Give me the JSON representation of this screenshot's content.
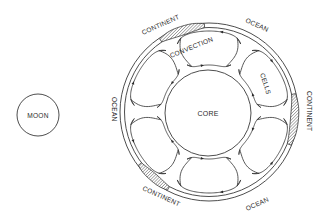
{
  "diagram": {
    "type": "earth-convection-cross-section",
    "labels": {
      "moon": "MOON",
      "core": "CORE",
      "convection": "CONVECTION",
      "cells": "CELLS",
      "continent_top": "CONTINENT",
      "continent_right": "CONTINENT",
      "continent_bottom": "CONTINENT",
      "ocean_top": "OCEAN",
      "ocean_left": "OCEAN",
      "ocean_bottom": "OCEAN"
    },
    "colors": {
      "stroke": "#3a3a3a",
      "hatch": "#555555",
      "background": "#ffffff"
    },
    "geometry": {
      "moon": {
        "cx": 38,
        "cy": 115,
        "r": 21
      },
      "earth": {
        "cx": 209,
        "cy": 112,
        "outer_r": 89,
        "shell_r": 84.5
      },
      "core": {
        "cx": 208,
        "cy": 113,
        "r": 43
      },
      "cells": [
        {
          "angle": -90,
          "dir": 1
        },
        {
          "angle": -30,
          "dir": -1
        },
        {
          "angle": 30,
          "dir": 1
        },
        {
          "angle": 90,
          "dir": -1
        },
        {
          "angle": 150,
          "dir": 1
        },
        {
          "angle": 210,
          "dir": -1
        }
      ],
      "cell_inner_r": 47,
      "cell_outer_r": 81,
      "cell_half_span_deg": 25,
      "continents": [
        {
          "start": -124,
          "end": -93,
          "thickness": 6
        },
        {
          "start": -12,
          "end": 22,
          "thickness": 5
        },
        {
          "start": 118,
          "end": 143,
          "thickness": 5
        }
      ]
    }
  }
}
